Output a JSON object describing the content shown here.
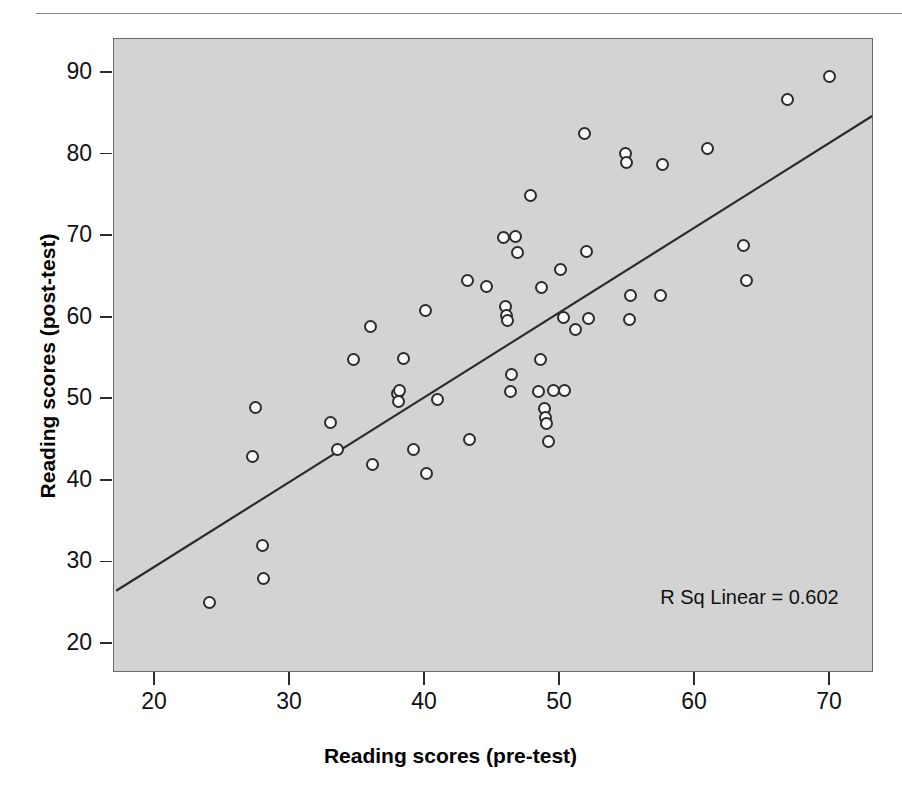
{
  "page": {
    "header_remnant": "",
    "background_color": "#ffffff"
  },
  "chart": {
    "plot_background_color": "#d3d3d3",
    "frame_color": "#6a6a6a",
    "marker_color": "#fbfbfb",
    "marker_edge_color": "#2c2c2c",
    "line_color": "#2b2b2b",
    "annotation": "R Sq Linear = 0.602",
    "xlabel": "Reading scores (pre-test)",
    "ylabel": "Reading scores (post-test)",
    "xticks": [
      "20",
      "30",
      "40",
      "50",
      "60",
      "70"
    ],
    "yticks": [
      "90",
      "80",
      "70",
      "60",
      "50",
      "40",
      "30",
      "20"
    ]
  },
  "chart_data": {
    "type": "scatter",
    "title": "",
    "xlabel": "Reading scores (pre-test)",
    "ylabel": "Reading scores (post-test)",
    "xlim": [
      17.0,
      73.5
    ],
    "ylim": [
      17.5,
      94.0
    ],
    "xticks": [
      20,
      30,
      40,
      50,
      60,
      70
    ],
    "yticks": [
      20,
      30,
      40,
      50,
      60,
      70,
      80,
      90
    ],
    "grid": false,
    "legend": null,
    "annotations": [
      {
        "text": "R Sq Linear = 0.602",
        "x": 57.5,
        "y": 27.0
      }
    ],
    "fit_line": {
      "type": "linear",
      "r_squared": 0.602,
      "label": "R Sq Linear = 0.602",
      "endpoints": [
        [
          17.2,
          26.4
        ],
        [
          73.2,
          84.6
        ]
      ],
      "slope": 1.04,
      "intercept": 8.5
    },
    "points": [
      [
        24.1,
        25.0
      ],
      [
        27.3,
        42.9
      ],
      [
        27.5,
        48.9
      ],
      [
        28.0,
        31.9
      ],
      [
        28.1,
        27.9
      ],
      [
        33.1,
        47.0
      ],
      [
        33.6,
        43.7
      ],
      [
        34.8,
        54.8
      ],
      [
        36.0,
        58.8
      ],
      [
        36.2,
        41.9
      ],
      [
        38.0,
        50.6
      ],
      [
        38.1,
        49.6
      ],
      [
        38.2,
        51.0
      ],
      [
        38.5,
        54.9
      ],
      [
        39.2,
        43.7
      ],
      [
        40.1,
        60.8
      ],
      [
        40.2,
        40.8
      ],
      [
        41.0,
        49.8
      ],
      [
        43.2,
        64.4
      ],
      [
        43.4,
        44.9
      ],
      [
        44.6,
        63.7
      ],
      [
        45.9,
        69.7
      ],
      [
        46.0,
        61.2
      ],
      [
        46.1,
        60.1
      ],
      [
        46.2,
        59.5
      ],
      [
        46.4,
        50.8
      ],
      [
        46.5,
        52.9
      ],
      [
        46.8,
        69.8
      ],
      [
        46.9,
        67.9
      ],
      [
        47.9,
        74.8
      ],
      [
        48.5,
        50.8
      ],
      [
        48.6,
        54.8
      ],
      [
        48.7,
        63.6
      ],
      [
        48.9,
        48.8
      ],
      [
        49.0,
        47.6
      ],
      [
        49.1,
        46.9
      ],
      [
        49.2,
        44.7
      ],
      [
        49.6,
        50.9
      ],
      [
        50.1,
        65.8
      ],
      [
        50.3,
        59.9
      ],
      [
        50.4,
        50.9
      ],
      [
        51.2,
        58.4
      ],
      [
        51.9,
        82.5
      ],
      [
        52.0,
        68.0
      ],
      [
        52.2,
        59.8
      ],
      [
        54.9,
        80.0
      ],
      [
        55.0,
        78.9
      ],
      [
        55.2,
        59.6
      ],
      [
        55.3,
        62.6
      ],
      [
        57.5,
        62.6
      ],
      [
        57.7,
        78.6
      ],
      [
        61.0,
        80.6
      ],
      [
        63.7,
        68.7
      ],
      [
        63.9,
        64.5
      ],
      [
        66.9,
        86.6
      ],
      [
        70.0,
        89.5
      ]
    ]
  }
}
